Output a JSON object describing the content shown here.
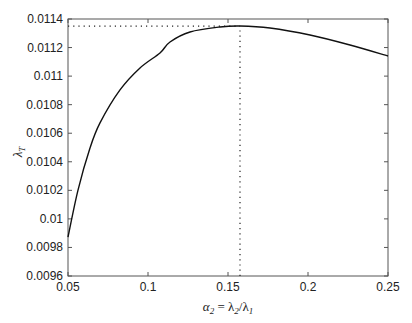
{
  "chart_data": {
    "type": "line",
    "title": "",
    "xlabel": "α2 = λ2/λ1",
    "ylabel": "λT",
    "xlim": [
      0.05,
      0.25
    ],
    "ylim": [
      0.0096,
      0.0114
    ],
    "grid": false,
    "legend": null,
    "x_ticks": [
      "0.05",
      "0.1",
      "0.15",
      "0.2",
      "0.25"
    ],
    "y_ticks": [
      "0.0096",
      "0.0098",
      "0.01",
      "0.0102",
      "0.0104",
      "0.0106",
      "0.0108",
      "0.011",
      "0.0112",
      "0.0114"
    ],
    "series": [
      {
        "name": "λT",
        "style": "solid",
        "color": "#111111",
        "x": [
          0.05,
          0.05625,
          0.06375,
          0.07,
          0.0825,
          0.095,
          0.1075,
          0.11375,
          0.12625,
          0.145,
          0.1575,
          0.17625,
          0.20125,
          0.22625,
          0.25
        ],
        "y": [
          0.009873,
          0.010202,
          0.010496,
          0.010672,
          0.010903,
          0.011057,
          0.011162,
          0.011239,
          0.011309,
          0.011344,
          0.011351,
          0.011337,
          0.011288,
          0.011218,
          0.011141
        ]
      }
    ],
    "annotations": [
      {
        "type": "hline-dotted",
        "y": 0.01135,
        "x_from": 0.05,
        "x_to": 0.1575,
        "label": "maximum λT"
      },
      {
        "type": "vline-dotted",
        "x": 0.1575,
        "y_from": 0.0096,
        "y_to": 0.01135,
        "label": "argmax α2"
      }
    ]
  },
  "labels": {
    "xlabel_main": "α",
    "xlabel_sub": "2",
    "xlabel_eq": " = λ",
    "xlabel_sub2": "2",
    "xlabel_slash": "/λ",
    "xlabel_sub3": "1",
    "ylabel_main": "λ",
    "ylabel_sub": "T"
  }
}
